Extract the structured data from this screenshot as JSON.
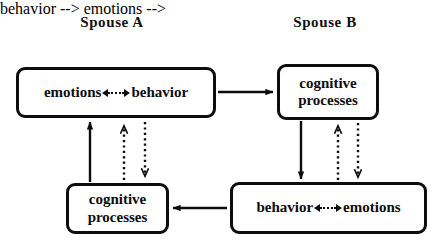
{
  "diagram": {
    "title_row": {
      "spouse_a": "Spouse A",
      "spouse_b": "Spouse B"
    },
    "colors": {
      "stroke": "#0d0d0d",
      "background": "#ffffff",
      "text": "#111111"
    },
    "nodes": [
      {
        "id": "a-emotions-behavior",
        "owner": "Spouse A",
        "layout": "inline",
        "left_term": "emotions",
        "connector": "dotted-bidirectional",
        "right_term": "behavior"
      },
      {
        "id": "b-cognitive",
        "owner": "Spouse B",
        "layout": "stacked",
        "line1": "cognitive",
        "line2": "processes"
      },
      {
        "id": "a-cognitive",
        "owner": "Spouse A",
        "layout": "stacked",
        "line1": "cognitive",
        "line2": "processes"
      },
      {
        "id": "b-behavior-emotions",
        "owner": "Spouse B",
        "layout": "inline",
        "left_term": "behavior",
        "connector": "dotted-bidirectional",
        "right_term": "emotions"
      }
    ],
    "connectors": [
      {
        "id": "a-behavior-to-b-cognitive",
        "style": "solid",
        "direction": "right",
        "from": "a-emotions-behavior",
        "to": "b-cognitive"
      },
      {
        "id": "b-cognitive-to-b-behavior",
        "style": "solid",
        "direction": "down",
        "from": "b-cognitive",
        "to": "b-behavior-emotions"
      },
      {
        "id": "b-behavior-to-a-cognitive",
        "style": "solid",
        "direction": "left",
        "from": "b-behavior-emotions",
        "to": "a-cognitive"
      },
      {
        "id": "a-cognitive-to-a-emotions",
        "style": "solid",
        "direction": "up",
        "from": "a-cognitive",
        "to": "a-emotions-behavior"
      },
      {
        "id": "a-cognitive-to-a-box-dotted-up",
        "style": "dotted",
        "direction": "up",
        "from": "a-cognitive",
        "to": "a-emotions-behavior"
      },
      {
        "id": "a-box-to-a-cognitive-dotted-down",
        "style": "dotted",
        "direction": "down",
        "from": "a-emotions-behavior",
        "to": "a-cognitive"
      },
      {
        "id": "b-behavior-to-b-cognitive-dotted-up",
        "style": "dotted",
        "direction": "up",
        "from": "b-behavior-emotions",
        "to": "b-cognitive"
      },
      {
        "id": "b-cognitive-to-b-behavior-dotted-down",
        "style": "dotted",
        "direction": "down",
        "from": "b-cognitive",
        "to": "b-behavior-emotions"
      }
    ]
  }
}
